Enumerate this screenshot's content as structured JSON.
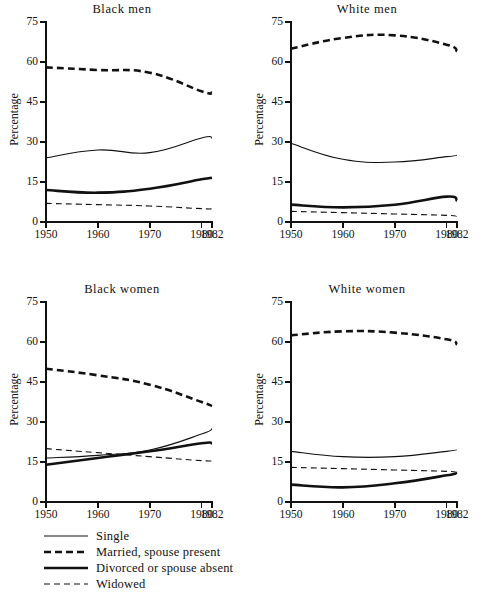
{
  "figure": {
    "ylabel": "Percentage",
    "xticks": [
      "1950",
      "1960",
      "1970",
      "1980",
      "1982"
    ],
    "yticks": [
      "0",
      "15",
      "30",
      "45",
      "60",
      "75"
    ]
  },
  "legend": {
    "items": [
      {
        "label": "Single",
        "style": "thin-solid"
      },
      {
        "label": "Married, spouse present",
        "style": "thick-dashed"
      },
      {
        "label": "Divorced or spouse absent",
        "style": "thick-solid"
      },
      {
        "label": "Widowed",
        "style": "thin-dashed"
      }
    ]
  },
  "chart_data": [
    {
      "type": "line",
      "title": "Black men",
      "xlabel": "",
      "ylabel": "Percentage",
      "x": [
        1950,
        1960,
        1970,
        1980,
        1982
      ],
      "xlim": [
        1950,
        1982
      ],
      "ylim": [
        0,
        75
      ],
      "grid": false,
      "legend_position": "below-figure",
      "series": [
        {
          "name": "Single",
          "style": "thin-solid",
          "values": [
            24.0,
            27.0,
            26.0,
            31.5,
            31.5
          ]
        },
        {
          "name": "Married, spouse present",
          "style": "thick-dashed",
          "values": [
            58.0,
            57.0,
            56.0,
            49.0,
            48.5
          ]
        },
        {
          "name": "Divorced or spouse absent",
          "style": "thick-solid",
          "values": [
            12.0,
            11.0,
            12.5,
            16.0,
            16.5
          ]
        },
        {
          "name": "Widowed",
          "style": "thin-dashed",
          "values": [
            7.0,
            6.5,
            6.0,
            5.0,
            5.0
          ]
        }
      ]
    },
    {
      "type": "line",
      "title": "White men",
      "xlabel": "",
      "ylabel": "Percentage",
      "x": [
        1950,
        1960,
        1970,
        1980,
        1982
      ],
      "xlim": [
        1950,
        1982
      ],
      "ylim": [
        0,
        75
      ],
      "grid": false,
      "legend_position": "below-figure",
      "series": [
        {
          "name": "Single",
          "style": "thin-solid",
          "values": [
            29.5,
            23.5,
            22.5,
            24.5,
            25.0
          ]
        },
        {
          "name": "Married, spouse present",
          "style": "thick-dashed",
          "values": [
            65.0,
            69.0,
            70.0,
            66.5,
            64.0
          ]
        },
        {
          "name": "Divorced or spouse absent",
          "style": "thick-solid",
          "values": [
            6.5,
            5.5,
            6.5,
            9.5,
            8.0
          ]
        },
        {
          "name": "Widowed",
          "style": "thin-dashed",
          "values": [
            4.0,
            3.5,
            3.0,
            2.5,
            2.0
          ]
        }
      ]
    },
    {
      "type": "line",
      "title": "Black women",
      "xlabel": "",
      "ylabel": "Percentage",
      "x": [
        1950,
        1960,
        1970,
        1980,
        1982
      ],
      "xlim": [
        1950,
        1982
      ],
      "ylim": [
        0,
        75
      ],
      "grid": false,
      "legend_position": "below-figure",
      "series": [
        {
          "name": "Single",
          "style": "thin-solid",
          "values": [
            16.5,
            17.5,
            19.5,
            25.5,
            27.5
          ]
        },
        {
          "name": "Married, spouse present",
          "style": "thick-dashed",
          "values": [
            50.0,
            47.5,
            44.0,
            37.5,
            36.0
          ]
        },
        {
          "name": "Divorced or spouse absent",
          "style": "thick-solid",
          "values": [
            14.0,
            16.5,
            19.0,
            22.0,
            22.0
          ]
        },
        {
          "name": "Widowed",
          "style": "thin-dashed",
          "values": [
            20.0,
            18.5,
            17.0,
            15.5,
            15.5
          ]
        }
      ]
    },
    {
      "type": "line",
      "title": "White women",
      "xlabel": "",
      "ylabel": "Percentage",
      "x": [
        1950,
        1960,
        1970,
        1980,
        1982
      ],
      "xlim": [
        1950,
        1982
      ],
      "ylim": [
        0,
        75
      ],
      "grid": false,
      "legend_position": "below-figure",
      "series": [
        {
          "name": "Single",
          "style": "thin-solid",
          "values": [
            19.0,
            17.0,
            17.0,
            19.0,
            19.5
          ]
        },
        {
          "name": "Married, spouse present",
          "style": "thick-dashed",
          "values": [
            62.5,
            64.0,
            63.5,
            61.0,
            59.0
          ]
        },
        {
          "name": "Divorced or spouse absent",
          "style": "thick-solid",
          "values": [
            6.5,
            5.5,
            7.0,
            10.0,
            11.0
          ]
        },
        {
          "name": "Widowed",
          "style": "thin-dashed",
          "values": [
            13.0,
            12.5,
            12.0,
            11.5,
            11.0
          ]
        }
      ]
    }
  ]
}
